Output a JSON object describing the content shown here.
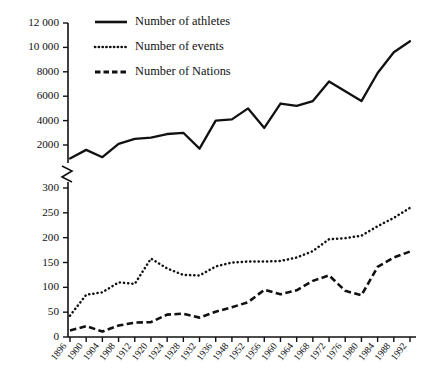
{
  "chart_data": {
    "type": "line",
    "title": "",
    "subtitle": "",
    "xlabel": "",
    "ylabel": "",
    "grid": false,
    "legend_position": "top-left-inside",
    "axis_break": true,
    "panels": [
      {
        "name": "upper",
        "ylim": [
          0,
          12000
        ],
        "yticks": [
          2000,
          4000,
          6000,
          8000,
          10000,
          12000
        ],
        "ytick_labels": [
          "2000",
          "4000",
          "6000",
          "8000",
          "10 000",
          "12 000"
        ]
      },
      {
        "name": "lower",
        "ylim": [
          0,
          300
        ],
        "yticks": [
          0,
          50,
          100,
          150,
          200,
          250,
          300
        ],
        "ytick_labels": [
          "0",
          "50",
          "100",
          "150",
          "200",
          "250",
          "300"
        ]
      }
    ],
    "categories": [
      "1896",
      "1900",
      "1904",
      "1908",
      "1912",
      "1920",
      "1924",
      "1928",
      "1932",
      "1936",
      "1948",
      "1952",
      "1956",
      "1960",
      "1964",
      "1968",
      "1972",
      "1976",
      "1980",
      "1984",
      "1988",
      "1992"
    ],
    "series": [
      {
        "name": "Number of athletes",
        "style": "solid",
        "panel": "upper",
        "values": [
          900,
          1600,
          1000,
          2100,
          2500,
          2600,
          2900,
          3000,
          1700,
          4000,
          4100,
          5000,
          3400,
          5400,
          5200,
          5600,
          7200,
          6400,
          5600,
          7900,
          9600,
          10500
        ]
      },
      {
        "name": "Number of events",
        "style": "dotted",
        "panel": "lower",
        "values": [
          43,
          85,
          90,
          110,
          107,
          158,
          138,
          125,
          124,
          142,
          150,
          152,
          152,
          153,
          160,
          173,
          197,
          199,
          204,
          223,
          240,
          260
        ]
      },
      {
        "name": "Number of Nations",
        "style": "dashed",
        "panel": "lower",
        "values": [
          13,
          22,
          11,
          23,
          29,
          30,
          45,
          47,
          39,
          51,
          60,
          70,
          95,
          86,
          94,
          113,
          124,
          93,
          84,
          141,
          160,
          172
        ]
      }
    ]
  },
  "legend": {
    "items": [
      {
        "label": "Number of athletes",
        "style": "solid"
      },
      {
        "label": "Number of events",
        "style": "dotted"
      },
      {
        "label": "Number of Nations",
        "style": "dashed"
      }
    ]
  },
  "colors": {
    "ink": "#111111",
    "background": "#ffffff"
  }
}
